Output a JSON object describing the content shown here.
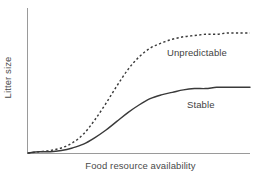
{
  "figure": {
    "width": 255,
    "height": 180,
    "background": "#ffffff",
    "line_color": "#3a3a3a",
    "axis_color": "#9a9a9a",
    "text_color": "#4a4a4a"
  },
  "axes": {
    "x_title": "Food resource availability",
    "y_title": "Litter size"
  },
  "labels": {
    "unpredictable": "Unpredictable",
    "stable": "Stable"
  },
  "chart_data": {
    "type": "line",
    "title": "",
    "subtitle": "",
    "xlabel": "Food resource availability",
    "ylabel": "Litter size",
    "xlim": [
      0,
      1
    ],
    "ylim": [
      0,
      1
    ],
    "grid": false,
    "legend": "inline-curve-labels",
    "x_ticks": [],
    "y_ticks": [],
    "annotations": [
      {
        "text": "Unpredictable",
        "x": 0.63,
        "y": 0.72,
        "series": "Unpredictable"
      },
      {
        "text": "Stable",
        "x": 0.72,
        "y": 0.37,
        "series": "Stable"
      }
    ],
    "x": [
      0.0,
      0.05,
      0.1,
      0.15,
      0.2,
      0.25,
      0.3,
      0.35,
      0.4,
      0.45,
      0.5,
      0.55,
      0.6,
      0.65,
      0.7,
      0.75,
      0.8,
      0.85,
      0.9,
      0.95,
      1.0
    ],
    "series": [
      {
        "name": "Unpredictable",
        "style": "dashed",
        "color": "#3a3a3a",
        "values": [
          0.0,
          0.01,
          0.02,
          0.04,
          0.08,
          0.15,
          0.26,
          0.39,
          0.53,
          0.66,
          0.76,
          0.83,
          0.87,
          0.9,
          0.92,
          0.93,
          0.94,
          0.94,
          0.95,
          0.95,
          0.95
        ]
      },
      {
        "name": "Stable",
        "style": "solid",
        "color": "#3a3a3a",
        "values": [
          0.0,
          0.01,
          0.01,
          0.02,
          0.04,
          0.07,
          0.12,
          0.18,
          0.25,
          0.32,
          0.38,
          0.43,
          0.46,
          0.48,
          0.5,
          0.51,
          0.51,
          0.52,
          0.52,
          0.52,
          0.52
        ]
      }
    ]
  }
}
